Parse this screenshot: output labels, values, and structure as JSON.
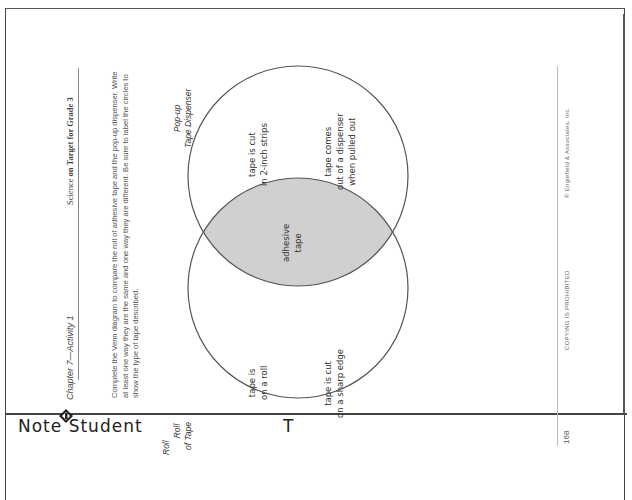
{
  "document": {
    "orientation": "rotated 90 degrees counterclockwise",
    "header": {
      "chapter": "Chapter 7—Activity 1",
      "series_prefix": "Science ",
      "series_bold": "on Target for Grade 3"
    },
    "instructions": "Complete the Venn diagram to compare the roll of adhesive tape and the pop-up dispenser. Write at least one way they are the same and one way they are different. Be sure to label the circles to show the type of tape described.",
    "venn": {
      "left_circle": {
        "label_line1": "Roll",
        "label_line2": "of Tape",
        "items": [
          {
            "line1": "tape is",
            "line2": "on a roll"
          },
          {
            "line1": "tape is cut",
            "line2": "on a sharp edge"
          }
        ]
      },
      "right_circle": {
        "label_line1": "Pop-up",
        "label_line2": "Tape Dispenser",
        "items": [
          {
            "line1": "tape is cut",
            "line2": "in 2-inch strips"
          },
          {
            "line1": "tape comes",
            "line2": "out of a dispenser",
            "line3": "when pulled out"
          }
        ]
      },
      "overlap": {
        "line1": "adhesive",
        "line2": "tape",
        "fill": "#d0d0d0"
      }
    },
    "footer": {
      "page_number": "168",
      "notice": "COPYING IS PROHIBITED",
      "copyright": "© Englefield & Associates, Inc."
    }
  },
  "bottom_note": {
    "left": "Note  Student",
    "right": "T"
  }
}
